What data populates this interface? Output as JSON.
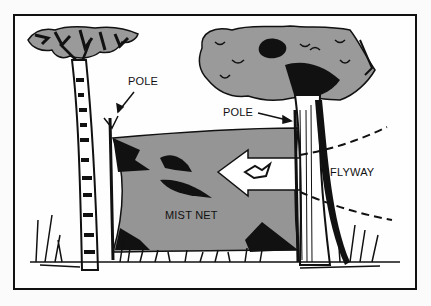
{
  "diagram": {
    "labels": {
      "pole_left": "POLE",
      "pole_right": "POLE",
      "flyway": "FLYWAY",
      "mist_net": "MIST NET"
    },
    "colors": {
      "net_fill": "#959595",
      "foliage_fill": "#9a9a9a",
      "ink": "#111111",
      "background": "#fefefe"
    },
    "elements": [
      "left-birch-tree",
      "right-oak-tree",
      "left-pole",
      "right-pole",
      "mist-net",
      "flyway-arrow",
      "bird-in-flight",
      "trapped-birds",
      "grass",
      "flyway-dashed-lines"
    ]
  }
}
